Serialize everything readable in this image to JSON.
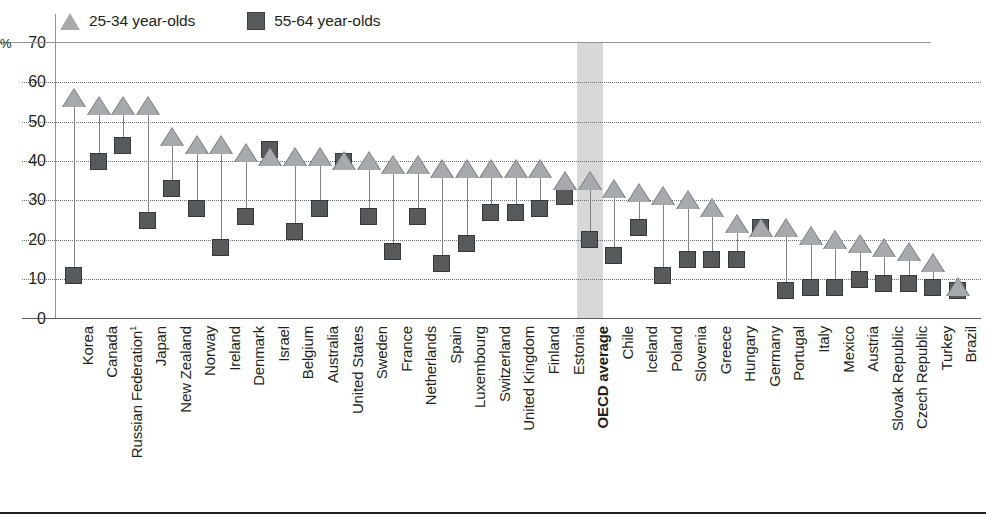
{
  "axis": {
    "percent_symbol": "%",
    "y_ticks": [
      70,
      60,
      50,
      40,
      30,
      20,
      10,
      0
    ],
    "y_min": 0,
    "y_max": 70
  },
  "legend": {
    "items": [
      {
        "label": "25-34 year-olds",
        "marker": "triangle-icon",
        "color": "#a7a9ac"
      },
      {
        "label": "55-64 year-olds",
        "marker": "square-icon",
        "color": "#58595b"
      }
    ]
  },
  "highlight": {
    "category": "OECD average",
    "color": "#d4d4d4"
  },
  "chart_data": {
    "type": "scatter",
    "title": "",
    "xlabel": "",
    "ylabel": "%",
    "ylim": [
      0,
      70
    ],
    "yticks": [
      0,
      10,
      20,
      30,
      40,
      50,
      60,
      70
    ],
    "grid": true,
    "legend_position": "top-left",
    "note": "Dumbbell chart: triangle = 25-34 year-olds, square = 55-64 year-olds, connected by a vertical line",
    "categories": [
      "Korea",
      "Canada",
      "Russian Federation¹",
      "Japan",
      "New Zealand",
      "Norway",
      "Ireland",
      "Denmark",
      "Israel",
      "Belgium",
      "Australia",
      "United States",
      "Sweden",
      "France",
      "Netherlands",
      "Spain",
      "Luxembourg",
      "Switzerland",
      "United Kingdom",
      "Finland",
      "Estonia",
      "OECD average",
      "Chile",
      "Iceland",
      "Poland",
      "Slovenia",
      "Greece",
      "Hungary",
      "Germany",
      "Portugal",
      "Italy",
      "Mexico",
      "Austria",
      "Slovak Republic",
      "Czech Republic",
      "Turkey",
      "Brazil"
    ],
    "series": [
      {
        "name": "25-34 year-olds",
        "color": "#a7a9ac",
        "values": [
          56,
          54,
          54,
          54,
          46,
          44,
          44,
          42,
          41,
          41,
          41,
          40,
          40,
          39,
          39,
          38,
          38,
          38,
          38,
          38,
          35,
          35,
          33,
          32,
          31,
          30,
          28,
          24,
          23,
          23,
          21,
          20,
          19,
          18,
          17,
          14,
          8
        ]
      },
      {
        "name": "55-64 year-olds",
        "color": "#58595b",
        "values": [
          11,
          40,
          44,
          25,
          33,
          28,
          18,
          26,
          43,
          22,
          28,
          40,
          26,
          17,
          26,
          14,
          19,
          27,
          27,
          28,
          31,
          20,
          16,
          23,
          11,
          15,
          15,
          15,
          23,
          7,
          8,
          8,
          10,
          9,
          9,
          8,
          7
        ]
      }
    ]
  }
}
